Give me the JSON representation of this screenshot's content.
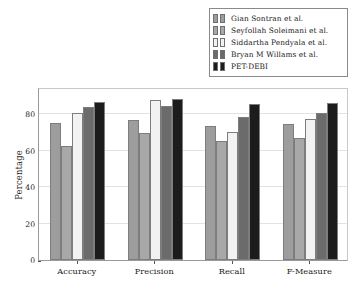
{
  "chart_data": {
    "type": "bar",
    "title": "",
    "xlabel": "",
    "ylabel": "Percentage",
    "categories": [
      "Accuracy",
      "Precision",
      "Recall",
      "F-Measure"
    ],
    "ylim": [
      0,
      95
    ],
    "yticks": [
      0,
      20,
      40,
      60,
      80
    ],
    "ytick_labels": [
      "0",
      "20",
      "40",
      "60",
      "80"
    ],
    "grid": true,
    "legend_position": "top-right",
    "series": [
      {
        "name": "Gian Sontran et al.",
        "color": "#9d9d9d",
        "values": [
          75.0,
          76.8,
          73.7,
          74.6
        ]
      },
      {
        "name": "Seyfollah Soleimani et al.",
        "color": "#a8a8a8",
        "values": [
          62.5,
          69.5,
          65.5,
          67.0
        ]
      },
      {
        "name": "Siddartha Pendyala et al.",
        "color": "#f2f2f2",
        "values": [
          80.6,
          88.0,
          70.3,
          77.6
        ]
      },
      {
        "name": "Bryan M Willams et al.",
        "color": "#6b6b6b",
        "values": [
          83.8,
          84.5,
          78.6,
          81.0
        ]
      },
      {
        "name": "PET-DEBI",
        "color": "#1c1c1c",
        "values": [
          87.0,
          88.2,
          85.6,
          86.4
        ]
      }
    ]
  }
}
